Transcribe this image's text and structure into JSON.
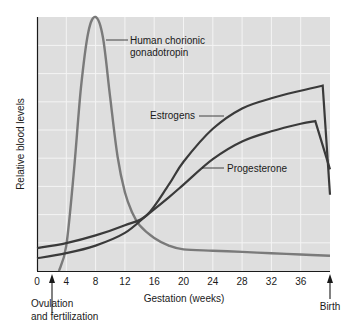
{
  "chart_data": {
    "type": "line",
    "title": "",
    "xlabel": "Gestation (weeks)",
    "ylabel": "Relative blood levels",
    "xlim": [
      0,
      40
    ],
    "ylim": [
      0,
      100
    ],
    "grid": true,
    "x_ticks": [
      0,
      4,
      8,
      12,
      16,
      20,
      24,
      28,
      32,
      36
    ],
    "y_ticks": [],
    "series": [
      {
        "name": "Human chorionic gonadotropin",
        "color": "#7a7a7a",
        "x": [
          3,
          4,
          5,
          6,
          7,
          8,
          9,
          10,
          11,
          12,
          13,
          14,
          16,
          18,
          20,
          24,
          28,
          32,
          36,
          40
        ],
        "y": [
          0,
          10,
          38,
          72,
          94,
          100,
          92,
          68,
          45,
          31,
          23,
          18,
          13,
          10,
          8.5,
          8,
          7.5,
          7,
          6.5,
          6
        ]
      },
      {
        "name": "Estrogens",
        "color": "#3a3a3a",
        "x": [
          0,
          4,
          8,
          12,
          15,
          18,
          20,
          24,
          28,
          32,
          36,
          39,
          40
        ],
        "y": [
          9,
          11,
          14,
          18,
          22,
          34,
          43,
          56,
          64,
          68,
          71,
          73,
          30
        ]
      },
      {
        "name": "Progesterone",
        "color": "#3a3a3a",
        "x": [
          0,
          4,
          8,
          12,
          15,
          18,
          20,
          24,
          28,
          32,
          36,
          38,
          40
        ],
        "y": [
          5,
          7,
          10,
          15,
          22,
          29,
          34,
          44,
          51,
          55,
          58,
          59,
          40
        ]
      }
    ],
    "annotations": [
      {
        "text": "Human chorionic gonadotropin",
        "points_to": "hcg"
      },
      {
        "text": "Estrogens",
        "points_to": "estrogen"
      },
      {
        "text": "Progesterone",
        "points_to": "progesterone"
      },
      {
        "text": "Ovulation and fertilization",
        "at_week": 2
      },
      {
        "text": "Birth",
        "at_week": 40
      }
    ],
    "legend": "none (inline labels)"
  },
  "labels": {
    "ylabel": "Relative blood levels",
    "xlabel": "Gestation (weeks)",
    "hcg_line1": "Human chorionic",
    "hcg_line2": "gonadotropin",
    "estrogens": "Estrogens",
    "progesterone": "Progesterone",
    "ovulation_line1": "Ovulation",
    "ovulation_line2": "and fertilization",
    "birth": "Birth"
  },
  "ticks": [
    "0",
    "4",
    "8",
    "12",
    "16",
    "20",
    "24",
    "28",
    "32",
    "36"
  ],
  "colors": {
    "plot_bg": "#dedede",
    "grid": "#f4f4f4",
    "axis": "#1a1a1a",
    "hcg": "#7a7a7a",
    "hormone": "#3a3a3a"
  }
}
